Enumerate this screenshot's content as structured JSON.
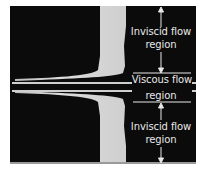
{
  "figure": {
    "labels": {
      "top_inviscid_line1": "Inviscid flow",
      "top_inviscid_line2": "region",
      "viscous_line1": "Viscous flow",
      "viscous_line2": "region",
      "bottom_inviscid_line1": "Inviscid flow",
      "bottom_inviscid_line2": "region"
    },
    "colors": {
      "background": "#0b0b0b",
      "smoke": "#d9d9d9",
      "text": "#e8e8e8",
      "page": "#ffffff"
    }
  }
}
